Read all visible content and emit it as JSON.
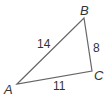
{
  "diagram": {
    "type": "triangle",
    "stroke_color": "#666666",
    "vertices": [
      {
        "label": "A",
        "x": 17,
        "y": 84
      },
      {
        "label": "B",
        "x": 84,
        "y": 18
      },
      {
        "label": "C",
        "x": 92,
        "y": 71
      }
    ],
    "sides": [
      {
        "between": "AB",
        "length": "14"
      },
      {
        "between": "BC",
        "length": "8"
      },
      {
        "between": "CA",
        "length": "11"
      }
    ]
  }
}
